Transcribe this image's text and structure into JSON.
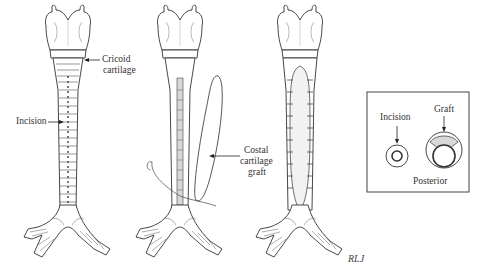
{
  "figure": {
    "panels": [
      {
        "id": "panel-1",
        "description": "Trachea with anterior incision along full length"
      },
      {
        "id": "panel-2",
        "description": "Costal cartilage graft being placed into incision with sutures"
      },
      {
        "id": "panel-3",
        "description": "Graft sutured into tracheal incision"
      },
      {
        "id": "panel-4",
        "description": "Cross-section inset showing incision and graft"
      }
    ],
    "labels": {
      "cricoid_1": "Cricoid",
      "cricoid_2": "cartilage",
      "incision": "Incision",
      "costal_1": "Costal",
      "costal_2": "cartilage",
      "costal_3": "graft",
      "inset_incision": "Incision",
      "inset_graft": "Graft",
      "inset_posterior": "Posterior",
      "signature": "RLJ"
    },
    "colors": {
      "line": "#3a3a3a",
      "graft_fill": "#d8d8d8",
      "background": "#ffffff"
    }
  }
}
